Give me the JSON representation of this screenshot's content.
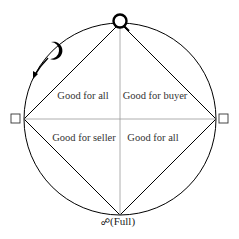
{
  "diagram": {
    "quadrants": {
      "top_left": "Good for all",
      "top_right": "Good for buyer",
      "bottom_left": "Good for seller",
      "bottom_right": "Good for all"
    },
    "markers": {
      "top": "☌",
      "upper_left": "☽",
      "left": "□",
      "right": "□",
      "bottom_symbol": "☍",
      "bottom_text": "(Full)"
    },
    "colors": {
      "stroke": "#000000",
      "grid_line": "#999999",
      "label": "#333333"
    }
  }
}
